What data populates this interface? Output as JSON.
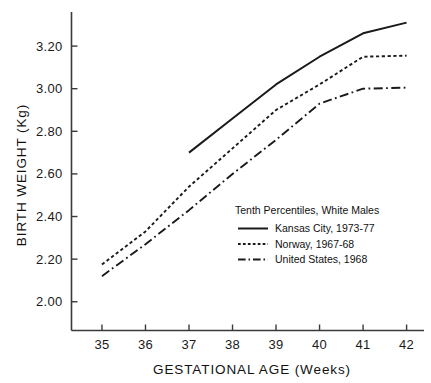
{
  "chart_data": {
    "type": "line",
    "title": "",
    "xlabel": "GESTATIONAL AGE (Weeks)",
    "ylabel": "BIRTH WEIGHT (Kg)",
    "x": [
      35,
      36,
      37,
      38,
      39,
      40,
      41,
      42
    ],
    "xtick_labels": [
      "35",
      "36",
      "37",
      "38",
      "39",
      "40",
      "41",
      "42"
    ],
    "ytick_labels": [
      "2.00",
      "2.20",
      "2.40",
      "2.60",
      "2.80",
      "3.00",
      "3.20"
    ],
    "ytick_values": [
      2.0,
      2.2,
      2.4,
      2.6,
      2.8,
      3.0,
      3.2
    ],
    "xlim": [
      34.3,
      42.4
    ],
    "ylim": [
      1.865,
      3.36
    ],
    "grid": false,
    "legend_position": "inside-lower-right",
    "legend_title": "Tenth Percentiles, White Males",
    "series": [
      {
        "name": "Kansas City, 1973-77",
        "style": "solid",
        "x": [
          37,
          38,
          39,
          40,
          41,
          42
        ],
        "values": [
          2.7,
          2.86,
          3.02,
          3.15,
          3.26,
          3.31
        ]
      },
      {
        "name": "Norway, 1967-68",
        "style": "dotted",
        "x": [
          35,
          36,
          37,
          38,
          39,
          40,
          41,
          42
        ],
        "values": [
          2.175,
          2.33,
          2.54,
          2.72,
          2.9,
          3.02,
          3.15,
          3.155
        ]
      },
      {
        "name": "United States, 1968",
        "style": "dash-dot",
        "x": [
          35,
          36,
          37,
          38,
          39,
          40,
          41,
          42
        ],
        "values": [
          2.12,
          2.27,
          2.43,
          2.6,
          2.76,
          2.93,
          3.0,
          3.005
        ]
      }
    ],
    "colors": {
      "line": "#1a1a1a",
      "axis": "#3a3a3a",
      "text": "#111111",
      "background": "#ffffff"
    }
  }
}
